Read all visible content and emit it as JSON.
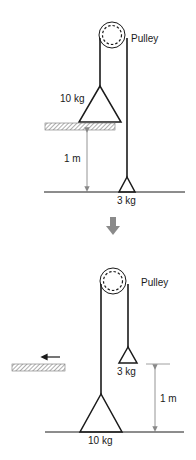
{
  "colors": {
    "ink": "#1a1a1a",
    "dimension": "#888888",
    "transition_arrow": "#8a8a8a",
    "hatch": "#777777"
  },
  "before": {
    "pulley_label": "Pulley",
    "heavy_mass_label": "10 kg",
    "light_mass_label": "3 kg",
    "height_label": "1 m"
  },
  "transition": {
    "icon": "down-arrow-icon"
  },
  "after": {
    "pulley_label": "Pulley",
    "heavy_mass_label": "10 kg",
    "light_mass_label": "3 kg",
    "height_label": "1 m",
    "ledge_motion_icon": "left-arrow-icon"
  }
}
